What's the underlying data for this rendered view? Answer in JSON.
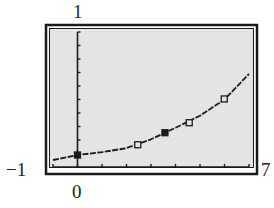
{
  "window_labels": {
    "xmin": "−1",
    "xmax": "7",
    "ymin": "0",
    "ymax": "1"
  },
  "colors": {
    "screen_bg": "#e4e4e4",
    "ink": "#1a1a1a",
    "page_bg": "#ffffff"
  },
  "chart_data": {
    "type": "scatter",
    "title": "",
    "xlabel": "",
    "ylabel": "",
    "xlim": [
      -1,
      7
    ],
    "ylim": [
      0,
      1
    ],
    "grid": false,
    "x_tick_step": 1,
    "y_tick_step": 0.1,
    "series": [
      {
        "name": "data points",
        "marker": "square",
        "x": [
          0,
          2.46,
          3.57,
          4.56,
          5.99
        ],
        "y": [
          0.089,
          0.165,
          0.254,
          0.328,
          0.504
        ],
        "filled": [
          true,
          false,
          true,
          false,
          false
        ]
      },
      {
        "name": "fitted exponential curve",
        "kind": "line",
        "x": [
          -1,
          0,
          1,
          2,
          3,
          4,
          5,
          6,
          7
        ],
        "y": [
          0.052,
          0.089,
          0.11,
          0.14,
          0.205,
          0.29,
          0.38,
          0.5,
          0.69
        ]
      }
    ],
    "legend": null
  }
}
